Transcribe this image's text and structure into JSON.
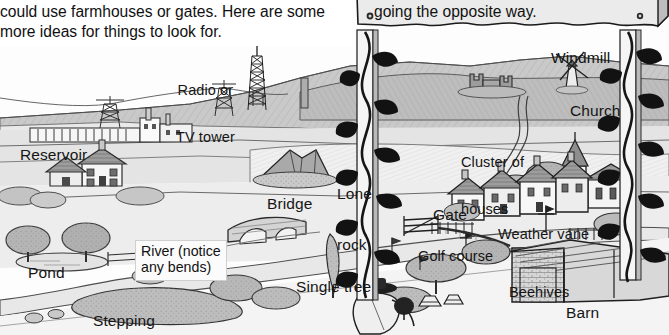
{
  "page": {
    "kind": "illustrated-landscape-spotting-guide",
    "palette": {
      "paper": "#ffffff",
      "ink": "#151515",
      "sky": "#fdfdfd",
      "far_hill": "#b9b9b9",
      "mid_hill": "#cccccc",
      "field_light": "#efefef",
      "field_mid": "#dcdcdc",
      "field_dark": "#c2c2c2",
      "water": "#e6e6e6",
      "tree": "#a9a9a9",
      "roof": "#9a9a9a",
      "sign_face": "#ebebeb",
      "sign_edge": "#7f7f7f",
      "post": "#f2f2f2",
      "ivy": "#1d1d1d"
    }
  },
  "intro": {
    "line1": "could use farmhouses or gates. Here are some",
    "line2": "more ideas for things to look for."
  },
  "sign": {
    "text": "going the opposite way.",
    "hole_left": "screw-hole",
    "hole_right": "screw-hole"
  },
  "labels": [
    {
      "id": "radio-tv-tower",
      "line1": "Radio or",
      "line2": "TV tower",
      "x": 176,
      "y": 52,
      "size": "sz15",
      "align": "center"
    },
    {
      "id": "windmill",
      "line1": "Windmill",
      "x": 551,
      "y": 50,
      "size": "sz16"
    },
    {
      "id": "church",
      "line1": "Church",
      "x": 570,
      "y": 103,
      "size": "sz16"
    },
    {
      "id": "cluster-houses",
      "line1": "Cluster of",
      "line2": "houses",
      "x": 461,
      "y": 124,
      "size": "sz15"
    },
    {
      "id": "reservoir",
      "line1": "Reservoir",
      "x": 20,
      "y": 147,
      "size": "sz16"
    },
    {
      "id": "lone-rock",
      "line1": "Lone",
      "line2": "rock",
      "x": 337,
      "y": 153,
      "size": "sz16"
    },
    {
      "id": "bridge",
      "line1": "Bridge",
      "x": 267,
      "y": 196,
      "size": "sz16"
    },
    {
      "id": "gate",
      "line1": "Gate",
      "x": 433,
      "y": 207,
      "size": "sz16"
    },
    {
      "id": "weather-vane",
      "line1": "Weather vane",
      "x": 498,
      "y": 227,
      "size": "sz15"
    },
    {
      "id": "golf-course",
      "line1": "Golf course",
      "x": 418,
      "y": 249,
      "size": "sz15"
    },
    {
      "id": "single-tree",
      "line1": "Single tree",
      "x": 296,
      "y": 279,
      "size": "sz16"
    },
    {
      "id": "beehives",
      "line1": "Beehives",
      "x": 509,
      "y": 285,
      "size": "sz15"
    },
    {
      "id": "barn",
      "line1": "Barn",
      "x": 566,
      "y": 305,
      "size": "sz16"
    },
    {
      "id": "pond",
      "line1": "Pond",
      "x": 28,
      "y": 265,
      "size": "sz16"
    },
    {
      "id": "stepping",
      "line1": "Stepping",
      "x": 93,
      "y": 313,
      "size": "sz16"
    }
  ],
  "callouts": [
    {
      "id": "river-note",
      "line1": "River (notice",
      "line2": "any bends)",
      "x": 135,
      "y": 240
    }
  ],
  "scenery": {
    "items": [
      "electricity-pylons",
      "power-lines",
      "radio-tv-tower",
      "reservoir-dam",
      "farmhouse",
      "lone-rock",
      "stone-bridge",
      "river",
      "pond",
      "stepping-stones",
      "single-tree",
      "golf-course-flags",
      "field-gate",
      "village-houses",
      "church-with-spire",
      "windmill",
      "castle-ruin",
      "barn",
      "beehives",
      "weather-vane",
      "hedgerows",
      "walker-figure"
    ]
  },
  "posts": [
    {
      "id": "left-post",
      "x": 362,
      "ivy": "ivy-vine"
    },
    {
      "id": "right-post",
      "x": 626,
      "ivy": "ivy-vine"
    }
  ]
}
